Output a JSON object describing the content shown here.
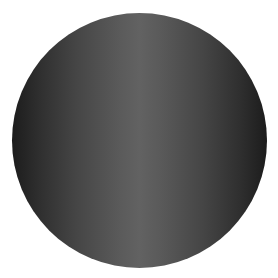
{
  "caption_fragment": "",
  "shape": {
    "type": "circle",
    "center_color": "#626262",
    "edge_color": "#1c1c1c",
    "background": "#ffffff"
  }
}
